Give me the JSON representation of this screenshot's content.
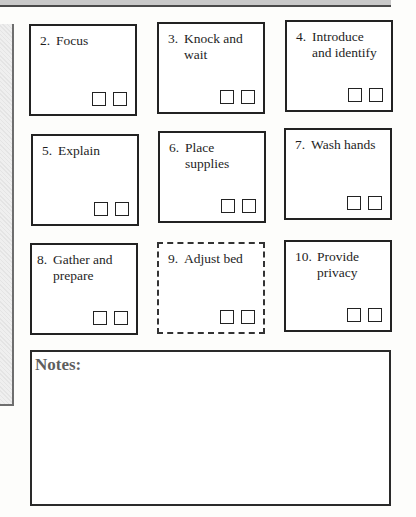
{
  "steps": [
    {
      "num": "2.",
      "text": "Focus",
      "checkboxes": 2,
      "border": "solid"
    },
    {
      "num": "3.",
      "text": "Knock and wait",
      "checkboxes": 2,
      "border": "solid"
    },
    {
      "num": "4.",
      "text": "Introduce and identify",
      "checkboxes": 2,
      "border": "solid"
    },
    {
      "num": "5.",
      "text": "Explain",
      "checkboxes": 2,
      "border": "solid"
    },
    {
      "num": "6.",
      "text": "Place supplies",
      "checkboxes": 2,
      "border": "solid"
    },
    {
      "num": "7.",
      "text": "Wash hands",
      "checkboxes": 2,
      "border": "solid"
    },
    {
      "num": "8.",
      "text": "Gather and prepare",
      "checkboxes": 2,
      "border": "solid"
    },
    {
      "num": "9.",
      "text": "Adjust bed",
      "checkboxes": 2,
      "border": "dashed"
    },
    {
      "num": "10.",
      "text": "Provide privacy",
      "checkboxes": 2,
      "border": "solid"
    }
  ],
  "notes": {
    "title": "Notes:",
    "content": ""
  },
  "colors": {
    "border": "#222222",
    "notes_title": "#5e5e5e",
    "side_panel": "#e8e8e8"
  }
}
